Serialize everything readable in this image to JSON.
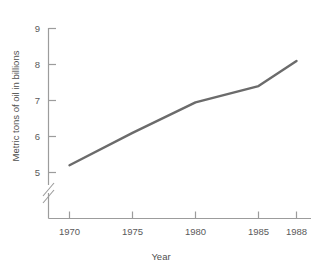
{
  "chart_data": {
    "type": "line",
    "title": "",
    "subtitle": "",
    "xlabel": "Year",
    "ylabel": "Metric tons of oil in billions",
    "x": [
      1970,
      1975,
      1980,
      1985,
      1988
    ],
    "values": [
      5.2,
      6.1,
      6.95,
      7.4,
      8.1
    ],
    "series": [
      {
        "name": "Metric tons of oil in billions",
        "values": [
          5.2,
          6.1,
          6.95,
          7.4,
          8.1
        ]
      }
    ],
    "x_tick_labels": [
      "1970",
      "1975",
      "1980",
      "1985",
      "1988"
    ],
    "y_tick_labels": [
      "5",
      "6",
      "7",
      "8",
      "9"
    ],
    "y_ticks": [
      5,
      6,
      7,
      8,
      9
    ],
    "ylim": [
      5,
      9
    ],
    "xlim": [
      1970,
      1988
    ],
    "grid": false,
    "legend": false,
    "legend_position": "none",
    "y_axis_break": true,
    "y_axis_break_label": "axis-break",
    "annotations": [],
    "line_color": "#6b6b6b",
    "axis_color": "#9c9c9c",
    "text_color": "#555555",
    "background_color": "#ffffff"
  },
  "axes": {
    "y_title": "Metric tons of oil in billions",
    "x_title": "Year",
    "y_ticks": [
      {
        "label": "9",
        "value": 9
      },
      {
        "label": "8",
        "value": 8
      },
      {
        "label": "7",
        "value": 7
      },
      {
        "label": "6",
        "value": 6
      },
      {
        "label": "5",
        "value": 5
      }
    ],
    "x_ticks": [
      {
        "label": "1970",
        "value": 1970
      },
      {
        "label": "1975",
        "value": 1975
      },
      {
        "label": "1980",
        "value": 1980
      },
      {
        "label": "1985",
        "value": 1985
      },
      {
        "label": "1988",
        "value": 1988
      }
    ]
  }
}
